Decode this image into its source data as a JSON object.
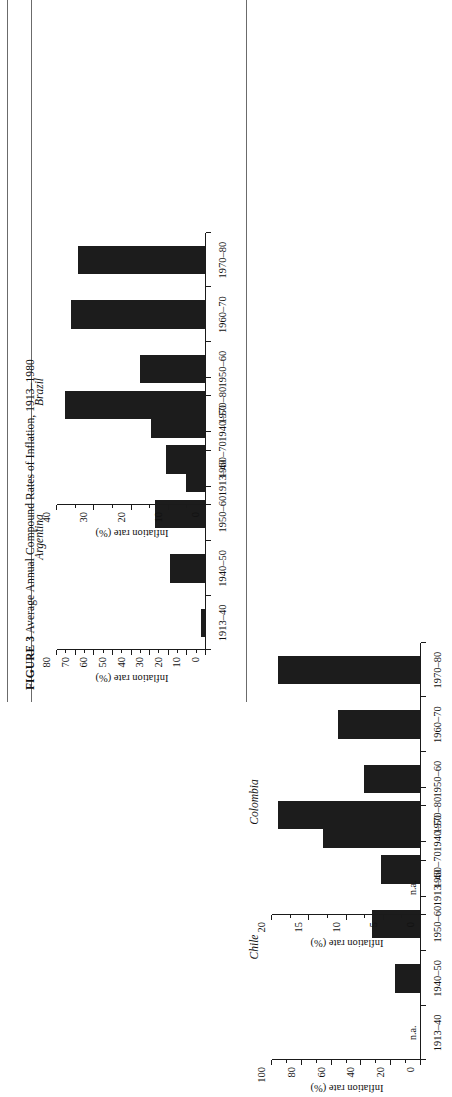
{
  "figure": {
    "label": "FIGURE 3",
    "caption": "Average Annual Compound Rates of Inflation, 1913–1980"
  },
  "axis": {
    "ylabel": "Inflation rate (%)",
    "na_label": "n.a."
  },
  "categories": [
    "1913–40",
    "1940–50",
    "1950–60",
    "1960–70",
    "1970–80"
  ],
  "panels": [
    {
      "title": "Argentina"
    },
    {
      "title": "Brazil"
    },
    {
      "title": "Chile"
    },
    {
      "title": "Colombia"
    }
  ],
  "chart_data": [
    {
      "type": "bar",
      "title": "Argentina",
      "categories": [
        "1913–40",
        "1940–50",
        "1950–60",
        "1960–70",
        "1970–80"
      ],
      "values": [
        2,
        19,
        27,
        21,
        75
      ],
      "xlabel": "",
      "ylabel": "Inflation rate (%)",
      "ylim": [
        0,
        80
      ],
      "yticks": [
        0,
        10,
        20,
        30,
        40,
        50,
        60,
        70,
        80
      ],
      "yminor_step": 5,
      "grid": false,
      "legend": "none"
    },
    {
      "type": "bar",
      "title": "Brazil",
      "categories": [
        "1913–40",
        "1940–50",
        "1950–60",
        "1960–70",
        "1970–80"
      ],
      "values": [
        5,
        14.5,
        17.5,
        36,
        34
      ],
      "xlabel": "",
      "ylabel": "Inflation rate (%)",
      "ylim": [
        0,
        40
      ],
      "yticks": [
        0,
        10,
        20,
        30,
        40
      ],
      "yminor_step": 5,
      "grid": false,
      "legend": "none"
    },
    {
      "type": "bar",
      "title": "Chile",
      "categories": [
        "1913–40",
        "1940–50",
        "1950–60",
        "1960–70",
        "1970–80"
      ],
      "values": [
        null,
        17,
        32,
        26,
        95
      ],
      "na_categories": [
        "1913–40"
      ],
      "xlabel": "",
      "ylabel": "Inflation rate (%)",
      "ylim": [
        0,
        100
      ],
      "yticks": [
        0,
        20,
        40,
        60,
        80,
        100
      ],
      "yminor_step": 10,
      "grid": false,
      "legend": "none"
    },
    {
      "type": "bar",
      "title": "Colombia",
      "categories": [
        "1913–40",
        "1940–50",
        "1950–60",
        "1960–70",
        "1970–80"
      ],
      "values": [
        null,
        13,
        7.5,
        11,
        19
      ],
      "na_categories": [
        "1913–40"
      ],
      "xlabel": "",
      "ylabel": "Inflation rate (%)",
      "ylim": [
        0,
        20
      ],
      "yticks": [
        0,
        5,
        10,
        15,
        20
      ],
      "yminor_step": 2.5,
      "grid": false,
      "legend": "none"
    }
  ],
  "colors": {
    "bar": "#1c1c1c",
    "axis": "#1a1a1a",
    "rule": "#6b6b6b",
    "page": "#ffffff"
  }
}
